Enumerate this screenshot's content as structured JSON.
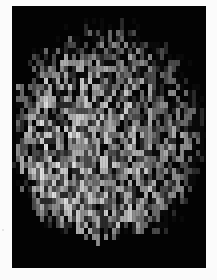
{
  "image": {
    "description": "Grayscale pixelated mosaic of a roughly circular blob of mottled gray blocks on a black background, framed by a thin white border",
    "background_color": "#030303",
    "border_color": "#fbfbfb",
    "blob": {
      "center_x": 97,
      "center_y": 128,
      "radius_x": 98,
      "radius_y": 112,
      "bottom_cutoff": 225,
      "cell_width": 4,
      "cell_height": 6,
      "seed": 7,
      "brightness_bias": "lower-left brighter"
    },
    "palette": [
      "#0a0a0a",
      "#2a2a2a",
      "#4a4a4a",
      "#6a6a6a",
      "#8c8c8c",
      "#ababab",
      "#c8c8c8",
      "#dedede"
    ]
  }
}
